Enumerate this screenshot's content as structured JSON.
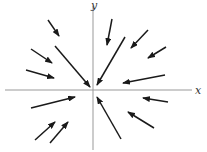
{
  "diagram": {
    "type": "vector-field",
    "axes": {
      "x_label": "x",
      "y_label": "y",
      "x_axis": {
        "x1": 5,
        "y1": 90,
        "x2": 192,
        "y2": 90
      },
      "y_axis": {
        "x1": 93,
        "y1": 6,
        "x2": 93,
        "y2": 150
      },
      "color": "#999999"
    },
    "arrow_color": "#1a1a1a",
    "arrows": [
      {
        "x1": 48,
        "y1": 20,
        "x2": 59,
        "y2": 36
      },
      {
        "x1": 55,
        "y1": 46,
        "x2": 90,
        "y2": 87
      },
      {
        "x1": 31,
        "y1": 49,
        "x2": 52,
        "y2": 63
      },
      {
        "x1": 26,
        "y1": 70,
        "x2": 54,
        "y2": 78
      },
      {
        "x1": 112,
        "y1": 19,
        "x2": 107,
        "y2": 45
      },
      {
        "x1": 125,
        "y1": 37,
        "x2": 97,
        "y2": 85
      },
      {
        "x1": 148,
        "y1": 30,
        "x2": 131,
        "y2": 48
      },
      {
        "x1": 166,
        "y1": 47,
        "x2": 148,
        "y2": 58
      },
      {
        "x1": 165,
        "y1": 75,
        "x2": 123,
        "y2": 83
      },
      {
        "x1": 31,
        "y1": 108,
        "x2": 75,
        "y2": 97
      },
      {
        "x1": 168,
        "y1": 102,
        "x2": 143,
        "y2": 98
      },
      {
        "x1": 121,
        "y1": 139,
        "x2": 97,
        "y2": 97
      },
      {
        "x1": 154,
        "y1": 128,
        "x2": 128,
        "y2": 112
      },
      {
        "x1": 35,
        "y1": 140,
        "x2": 55,
        "y2": 122
      },
      {
        "x1": 50,
        "y1": 143,
        "x2": 68,
        "y2": 122
      }
    ]
  }
}
